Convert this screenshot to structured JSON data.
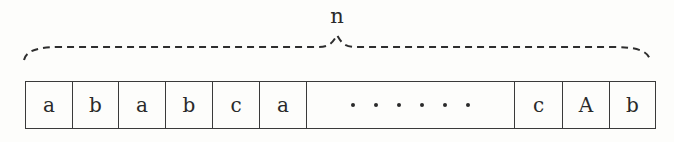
{
  "diagram": {
    "brace_label": "n",
    "cells": [
      {
        "text": "a",
        "width": 47
      },
      {
        "text": "b",
        "width": 46
      },
      {
        "text": "a",
        "width": 47
      },
      {
        "text": "b",
        "width": 47
      },
      {
        "text": "c",
        "width": 47
      },
      {
        "text": "a",
        "width": 47
      },
      {
        "text": "······",
        "width": 208,
        "ellipsis": true,
        "dot_count": 6
      },
      {
        "text": "c",
        "width": 48
      },
      {
        "text": "A",
        "width": 47
      },
      {
        "text": "b",
        "width": 46
      }
    ],
    "colors": {
      "line": "#3a3a3a",
      "text": "#2a2a2a",
      "background": "#fdfdfb"
    }
  }
}
